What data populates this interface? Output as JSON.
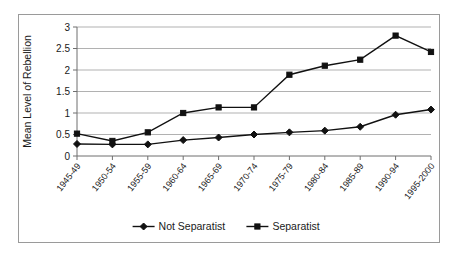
{
  "chart_data": {
    "type": "line",
    "title": "",
    "xlabel": "",
    "ylabel": "Mean Level of Rebellion",
    "ylim": [
      0,
      3
    ],
    "yticks": [
      "0",
      "0.5",
      "1",
      "1.5",
      "2",
      "2.5",
      "3"
    ],
    "grid": true,
    "legend_position": "bottom",
    "categories": [
      "1945-49",
      "1950-54",
      "1955-59",
      "1960-64",
      "1965-69",
      "1970-74",
      "1975-79",
      "1980-84",
      "1985-89",
      "1990-94",
      "1995-2000"
    ],
    "series": [
      {
        "name": "Not Separatist",
        "marker": "diamond",
        "values": [
          0.28,
          0.27,
          0.27,
          0.37,
          0.43,
          0.5,
          0.55,
          0.59,
          0.68,
          0.96,
          1.08
        ]
      },
      {
        "name": "Separatist",
        "marker": "square",
        "values": [
          0.52,
          0.35,
          0.55,
          1.0,
          1.13,
          1.13,
          1.89,
          2.1,
          2.24,
          2.8,
          2.42
        ]
      }
    ]
  },
  "legend": {
    "items": [
      {
        "label": "Not Separatist",
        "marker": "diamond"
      },
      {
        "label": "Separatist",
        "marker": "square"
      }
    ]
  },
  "colors": {
    "series": "#111111",
    "gridline": "#a8a8a8",
    "axis": "#6e6e6e",
    "frame": "#9a9a9a",
    "background": "#ffffff"
  }
}
